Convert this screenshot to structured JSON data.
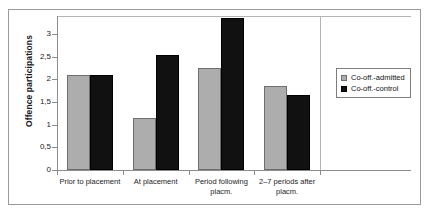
{
  "chart_data": {
    "type": "bar",
    "title": "",
    "xlabel": "",
    "ylabel": "Offence participations",
    "ylim": [
      0,
      3.4
    ],
    "ytick_labels": [
      "0",
      "0,5",
      "1",
      "1,5",
      "2",
      "2,5",
      "3"
    ],
    "ytick_values": [
      0,
      0.5,
      1,
      1.5,
      2,
      2.5,
      3
    ],
    "grid": false,
    "legend_position": "right",
    "categories": [
      "Prior to placement",
      "At placement",
      "Period following placm.",
      "2–7 periods after placm."
    ],
    "series": [
      {
        "name": "Co-off.-admitted",
        "color": "#adadad",
        "values": [
          2.1,
          1.15,
          2.25,
          1.85
        ]
      },
      {
        "name": "Co-off.-control",
        "color": "#111111",
        "values": [
          2.1,
          2.55,
          3.35,
          1.65
        ]
      }
    ]
  },
  "legend": {
    "items": [
      {
        "label": "Co-off.-admitted"
      },
      {
        "label": "Co-off.-control"
      }
    ]
  }
}
